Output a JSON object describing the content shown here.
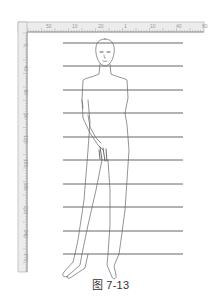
{
  "figure": {
    "caption": "图 7-13",
    "colors": {
      "ruler_band": "#ececec",
      "ruler_border": "#999999",
      "ruler_text": "#9a9a9a",
      "grid_line": "#555555",
      "figure_stroke": "#666666",
      "background": "#ffffff"
    }
  },
  "ruler": {
    "horizontal_labels": [
      "%",
      "50",
      "10",
      "20",
      "1",
      "10",
      "40",
      "80"
    ],
    "vertical_labels": [
      "0",
      "40",
      "60",
      "90",
      "120",
      "150",
      "180",
      "210",
      "240",
      "270"
    ]
  },
  "grid": {
    "line_count": 10,
    "line_y": [
      43,
      66,
      90,
      113,
      137,
      160,
      184,
      207,
      231,
      254
    ],
    "x_start": 63,
    "x_end": 183
  }
}
